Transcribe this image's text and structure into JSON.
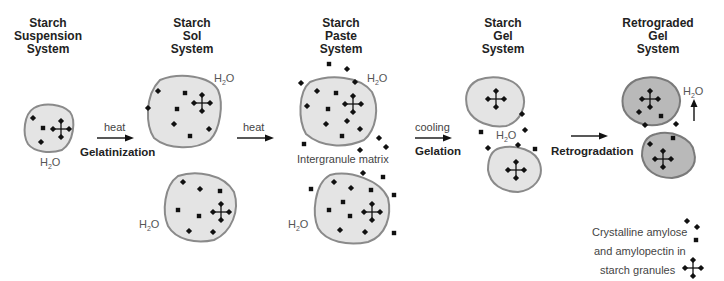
{
  "stages": [
    {
      "id": "suspension",
      "title": [
        "Starch",
        "Suspension",
        "System"
      ],
      "x": 60
    },
    {
      "id": "sol",
      "title": [
        "Starch",
        "Sol",
        "System"
      ],
      "x": 192
    },
    {
      "id": "paste",
      "title": [
        "Starch",
        "Paste",
        "System"
      ],
      "x": 341
    },
    {
      "id": "gel",
      "title": [
        "Starch",
        "Gel",
        "System"
      ],
      "x": 503
    },
    {
      "id": "retrograded",
      "title": [
        "Retrograded",
        "Gel",
        "System"
      ],
      "x": 658
    }
  ],
  "transitions": [
    {
      "above": "heat",
      "below": "Gelatinization",
      "x1": 97,
      "x2": 133,
      "y": 138
    },
    {
      "above": "heat",
      "below": "",
      "x1": 237,
      "x2": 273,
      "y": 138
    },
    {
      "above": "cooling",
      "below": "Gelation",
      "x1": 415,
      "x2": 451,
      "y": 138
    },
    {
      "above": "",
      "below": "Retrogradation",
      "x1": 571,
      "x2": 607,
      "y": 138
    }
  ],
  "labels": {
    "water": "H",
    "water_sub": "2",
    "water_tail": "O",
    "intergranule": "Intergranule matrix",
    "legend_line1": "Crystalline amylose",
    "legend_line2": "and amylopectin in",
    "legend_line3": "starch granules"
  },
  "colors": {
    "granule_fill": "#e4e4e4",
    "retrograded_fill": "#b9b9b9",
    "outline": "#8a8a8a",
    "marker": "#111111"
  }
}
